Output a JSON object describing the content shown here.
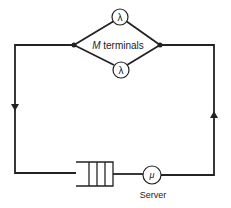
{
  "diagram": {
    "terminals": {
      "label_italic": "M",
      "label_rest": " terminals",
      "rate_symbol": "λ"
    },
    "server": {
      "label": "Server",
      "rate_symbol": "μ"
    },
    "colors": {
      "line": "#222222",
      "background": "#ffffff"
    }
  }
}
